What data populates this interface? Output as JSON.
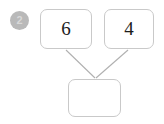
{
  "diagram": {
    "type": "number-bond-addition",
    "step_badge": {
      "label": "2",
      "color": "#b9b9b9",
      "text_color": "#d8d8d8"
    },
    "boxes": [
      {
        "id": "addend-a",
        "value": "6",
        "role": "addend",
        "filled": true
      },
      {
        "id": "addend-b",
        "value": "4",
        "role": "addend",
        "filled": true
      },
      {
        "id": "sum-box",
        "value": "",
        "role": "sum",
        "filled": false
      }
    ],
    "connectors": [
      {
        "from": "addend-a",
        "to": "sum-box",
        "style": "arrow"
      },
      {
        "from": "addend-b",
        "to": "sum-box",
        "style": "arrow"
      }
    ],
    "colors": {
      "background": "#ffffff",
      "box_border": "#c9c9c9",
      "connector": "#b0b0b0",
      "digit": "#1c1c1c"
    }
  }
}
